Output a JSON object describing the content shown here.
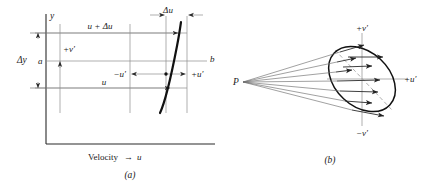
{
  "figure": {
    "panel_a": {
      "caption": "(a)",
      "y_axis_label": "y",
      "x_axis_label_text": "Velocity",
      "x_axis_label_arrow": "→",
      "x_axis_label_var": "u",
      "delta_y_label": "Δy",
      "delta_u_label": "Δu",
      "top_line_label": "u + Δu",
      "bottom_line_label": "u",
      "point_a_label": "a",
      "point_b_label": "b",
      "plus_v_prime_label": "+v′",
      "minus_u_prime_label": "−u′",
      "plus_u_prime_label": "+u′"
    },
    "panel_b": {
      "caption": "(b)",
      "origin_label": "P",
      "plus_v_prime_label": "+v′",
      "minus_v_prime_label": "−v′",
      "plus_u_prime_label": "+u′"
    }
  },
  "colors": {
    "background": "#ffffff",
    "ink": "#1a1a1a",
    "axis": "#2a2a2a",
    "grid": "#8d8d8d",
    "curve": "#111111",
    "ray": "#6e6e6e",
    "dashed_axis": "#9a9a9a"
  }
}
